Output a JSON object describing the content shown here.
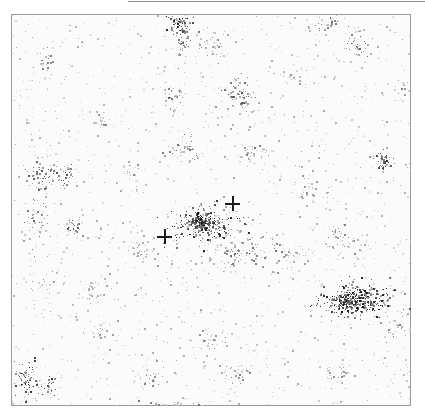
{
  "image": {
    "description": "Grayscale speckle/density map with two crosshair markers",
    "background_color": "#fbfbfb",
    "frame_color": "#9a9a9a",
    "speckle_color": "#1a1a1a"
  },
  "markers": [
    {
      "name": "crosshair-left",
      "x": 164,
      "y": 236
    },
    {
      "name": "crosshair-right",
      "x": 232,
      "y": 203
    }
  ],
  "clusters": [
    {
      "x": 178,
      "y": 20,
      "rx": 10,
      "ry": 10,
      "n": 70,
      "dark": 0.9
    },
    {
      "x": 183,
      "y": 40,
      "rx": 8,
      "ry": 18,
      "n": 40,
      "dark": 0.7
    },
    {
      "x": 205,
      "y": 224,
      "rx": 28,
      "ry": 14,
      "n": 260,
      "dark": 0.9
    },
    {
      "x": 200,
      "y": 222,
      "rx": 8,
      "ry": 6,
      "n": 90,
      "dark": 1.0
    },
    {
      "x": 235,
      "y": 250,
      "rx": 40,
      "ry": 20,
      "n": 120,
      "dark": 0.6
    },
    {
      "x": 355,
      "y": 300,
      "rx": 30,
      "ry": 14,
      "n": 320,
      "dark": 0.95
    },
    {
      "x": 350,
      "y": 300,
      "rx": 14,
      "ry": 6,
      "n": 110,
      "dark": 1.0
    },
    {
      "x": 382,
      "y": 160,
      "rx": 8,
      "ry": 10,
      "n": 50,
      "dark": 0.85
    },
    {
      "x": 25,
      "y": 380,
      "rx": 12,
      "ry": 16,
      "n": 80,
      "dark": 0.85
    },
    {
      "x": 48,
      "y": 385,
      "rx": 8,
      "ry": 8,
      "n": 30,
      "dark": 0.8
    },
    {
      "x": 40,
      "y": 175,
      "rx": 18,
      "ry": 12,
      "n": 60,
      "dark": 0.7
    },
    {
      "x": 65,
      "y": 175,
      "rx": 8,
      "ry": 10,
      "n": 30,
      "dark": 0.7
    },
    {
      "x": 35,
      "y": 220,
      "rx": 14,
      "ry": 22,
      "n": 50,
      "dark": 0.6
    },
    {
      "x": 73,
      "y": 227,
      "rx": 6,
      "ry": 6,
      "n": 25,
      "dark": 0.8
    },
    {
      "x": 240,
      "y": 95,
      "rx": 16,
      "ry": 14,
      "n": 60,
      "dark": 0.7
    },
    {
      "x": 175,
      "y": 95,
      "rx": 10,
      "ry": 10,
      "n": 30,
      "dark": 0.6
    },
    {
      "x": 185,
      "y": 150,
      "rx": 15,
      "ry": 10,
      "n": 45,
      "dark": 0.6
    },
    {
      "x": 253,
      "y": 150,
      "rx": 12,
      "ry": 8,
      "n": 30,
      "dark": 0.55
    },
    {
      "x": 330,
      "y": 20,
      "rx": 12,
      "ry": 10,
      "n": 35,
      "dark": 0.6
    },
    {
      "x": 357,
      "y": 45,
      "rx": 10,
      "ry": 10,
      "n": 35,
      "dark": 0.7
    },
    {
      "x": 210,
      "y": 45,
      "rx": 12,
      "ry": 10,
      "n": 30,
      "dark": 0.55
    },
    {
      "x": 45,
      "y": 60,
      "rx": 10,
      "ry": 12,
      "n": 30,
      "dark": 0.55
    },
    {
      "x": 100,
      "y": 120,
      "rx": 10,
      "ry": 10,
      "n": 20,
      "dark": 0.5
    },
    {
      "x": 140,
      "y": 250,
      "rx": 8,
      "ry": 10,
      "n": 25,
      "dark": 0.55
    },
    {
      "x": 340,
      "y": 240,
      "rx": 18,
      "ry": 14,
      "n": 45,
      "dark": 0.55
    },
    {
      "x": 290,
      "y": 255,
      "rx": 14,
      "ry": 12,
      "n": 30,
      "dark": 0.5
    },
    {
      "x": 305,
      "y": 190,
      "rx": 20,
      "ry": 14,
      "n": 35,
      "dark": 0.45
    },
    {
      "x": 150,
      "y": 375,
      "rx": 14,
      "ry": 10,
      "n": 30,
      "dark": 0.55
    },
    {
      "x": 230,
      "y": 375,
      "rx": 16,
      "ry": 10,
      "n": 35,
      "dark": 0.5
    },
    {
      "x": 335,
      "y": 375,
      "rx": 14,
      "ry": 10,
      "n": 25,
      "dark": 0.5
    },
    {
      "x": 210,
      "y": 340,
      "rx": 15,
      "ry": 12,
      "n": 30,
      "dark": 0.5
    },
    {
      "x": 100,
      "y": 330,
      "rx": 15,
      "ry": 12,
      "n": 25,
      "dark": 0.45
    },
    {
      "x": 45,
      "y": 290,
      "rx": 12,
      "ry": 14,
      "n": 25,
      "dark": 0.45
    },
    {
      "x": 95,
      "y": 290,
      "rx": 12,
      "ry": 10,
      "n": 25,
      "dark": 0.5
    },
    {
      "x": 170,
      "y": 405,
      "rx": 25,
      "ry": 3,
      "n": 30,
      "dark": 0.6
    },
    {
      "x": 130,
      "y": 175,
      "rx": 8,
      "ry": 10,
      "n": 15,
      "dark": 0.5
    },
    {
      "x": 402,
      "y": 90,
      "rx": 6,
      "ry": 10,
      "n": 15,
      "dark": 0.5
    },
    {
      "x": 290,
      "y": 75,
      "rx": 14,
      "ry": 10,
      "n": 20,
      "dark": 0.45
    },
    {
      "x": 395,
      "y": 330,
      "rx": 10,
      "ry": 16,
      "n": 25,
      "dark": 0.55
    }
  ],
  "background_noise": {
    "count": 1400,
    "dark": 0.35
  }
}
